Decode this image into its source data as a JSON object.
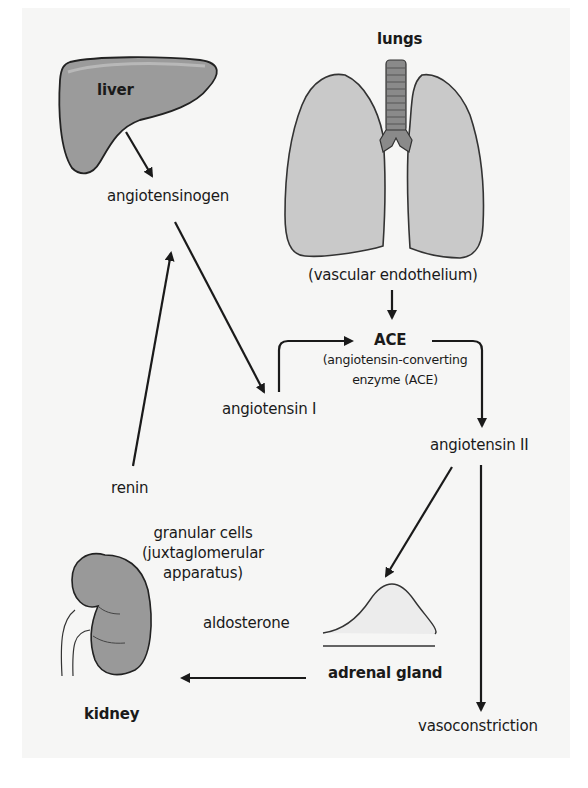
{
  "organs": {
    "liver": "liver",
    "lungs": "lungs",
    "kidney": "kidney",
    "adrenal_gland": "adrenal gland"
  },
  "nodes": {
    "angiotensinogen": "angiotensinogen",
    "vascular_endothelium": "(vascular endothelium)",
    "ace": "ACE",
    "ace_desc_line1": "(angiotensin-converting",
    "ace_desc_line2": "enzyme (ACE)",
    "angiotensin_1": "angiotensin I",
    "angiotensin_2": "angiotensin II",
    "renin": "renin",
    "granular_line1": "granular cells",
    "granular_line2": "(juxtaglomerular",
    "granular_line3": "apparatus)",
    "aldosterone": "aldosterone",
    "vasoconstriction": "vasoconstriction"
  },
  "flows": [
    {
      "from": "liver",
      "to": "angiotensinogen"
    },
    {
      "from": "renin",
      "to": "angiotensinogen"
    },
    {
      "from": "angiotensinogen",
      "to": "angiotensin I"
    },
    {
      "from": "vascular endothelium",
      "to": "ACE"
    },
    {
      "from": "angiotensin I",
      "to": "ACE"
    },
    {
      "from": "ACE",
      "to": "angiotensin II"
    },
    {
      "from": "angiotensin II",
      "to": "adrenal gland"
    },
    {
      "from": "angiotensin II",
      "to": "vasoconstriction"
    },
    {
      "from": "adrenal gland",
      "to": "kidney",
      "label": "aldosterone"
    }
  ],
  "colors": {
    "organ_fill": "#9a9a9a",
    "lung_fill": "#c9c9c9",
    "background": "#f6f6f5",
    "stroke": "#1a1a1a"
  }
}
